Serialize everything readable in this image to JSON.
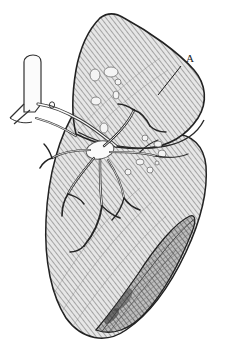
{
  "figure": {
    "domain": "anatomical-engraving",
    "style": "cross-hatched line engraving",
    "background_color": "#ffffff",
    "ink_color": "#1a1a1a",
    "hatch_color": "#9a9a9a",
    "tissue_fill": "#c9c9c9",
    "shadow_fill": "#8a8a8a",
    "nodule_fill": "#f4f4f4",
    "canvas": {
      "width": 232,
      "height": 353
    }
  },
  "labels": [
    {
      "id": "A",
      "text": "A",
      "x": 186,
      "y": 62,
      "leader_from": {
        "x": 181,
        "y": 66
      },
      "leader_to": {
        "x": 158,
        "y": 95
      },
      "description": "leader line to upper lobe posterior border"
    }
  ],
  "parts": {
    "upper_lobe": "Upper lobe with hatched surface and pale nodules",
    "lower_lobe": "Lower lobe with oblique fissure and diaphragmatic surface",
    "trachea": "Trachea with cartilage rings at upper left",
    "bronchus": "Main bronchus entering the hilum",
    "hilum": "Hilum with radiating bronchial and vascular tree",
    "bronchial_tree": "Branching bronchioles with dark terminal tips",
    "oblique_fissure": "Oblique fissure dividing the lobes",
    "diaphragmatic_surface": "Shaded concave base of the lung"
  },
  "nodules": [
    {
      "cx": 95,
      "cy": 75,
      "rx": 5,
      "ry": 6
    },
    {
      "cx": 111,
      "cy": 72,
      "rx": 7,
      "ry": 5
    },
    {
      "cx": 118,
      "cy": 82,
      "rx": 3,
      "ry": 3
    },
    {
      "cx": 116,
      "cy": 95,
      "rx": 3,
      "ry": 4
    },
    {
      "cx": 96,
      "cy": 101,
      "rx": 5,
      "ry": 4
    },
    {
      "cx": 104,
      "cy": 128,
      "rx": 4,
      "ry": 5
    },
    {
      "cx": 145,
      "cy": 138,
      "rx": 3,
      "ry": 3
    },
    {
      "cx": 158,
      "cy": 144,
      "rx": 4,
      "ry": 3
    },
    {
      "cx": 162,
      "cy": 154,
      "rx": 4,
      "ry": 4
    },
    {
      "cx": 140,
      "cy": 162,
      "rx": 4,
      "ry": 3
    },
    {
      "cx": 150,
      "cy": 170,
      "rx": 3,
      "ry": 3
    },
    {
      "cx": 128,
      "cy": 172,
      "rx": 3,
      "ry": 3
    },
    {
      "cx": 157,
      "cy": 163,
      "rx": 2,
      "ry": 2
    }
  ]
}
